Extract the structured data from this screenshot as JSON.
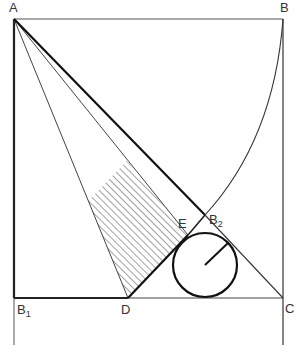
{
  "labels": {
    "A": "A",
    "B": "B",
    "C": "C",
    "D": "D",
    "E": "E",
    "B1": "B",
    "B1_sub": "1",
    "B2": "B",
    "B2_sub": "2"
  },
  "colors": {
    "line": "#222222",
    "background": "#ffffff"
  }
}
